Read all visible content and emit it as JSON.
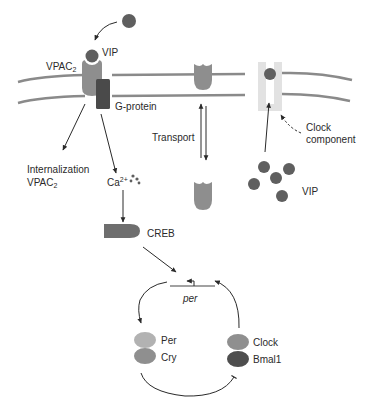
{
  "diagram": {
    "labels": {
      "vip_top": "VIP",
      "vpac2_top": "VPAC",
      "vpac2_top_sub": "2",
      "g_protein": "G-protein",
      "internalization_line1": "Internalization",
      "internalization_line2": "VPAC",
      "internalization_sub": "2",
      "ca": "Ca",
      "ca_sup": "2+",
      "transport": "Transport",
      "clock_component_line1": "Clock",
      "clock_component_line2": "component",
      "vip_cluster": "VIP",
      "creb": "CREB",
      "per_gene": "per",
      "per": "Per",
      "cry": "Cry",
      "clock": "Clock",
      "bmal1": "Bmal1"
    },
    "colors": {
      "vip": "#5f5f5f",
      "vpac2_receptor": "#8e8e8e",
      "g_protein": "#4a4a4a",
      "membrane": "#8a8a8a",
      "clock_component_channel": "#e2e2e2",
      "creb": "#6e6e6e",
      "per_protein": "#b2b2b2",
      "cry_protein": "#8f8f8f",
      "clock_protein": "#8f8f8f",
      "bmal1_protein": "#4e4e4e",
      "arrow": "#2a2a2a"
    }
  }
}
